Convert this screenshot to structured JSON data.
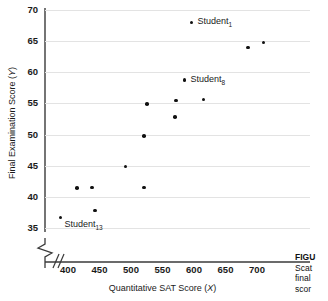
{
  "figure": {
    "axes": {
      "y": {
        "label_prefix": "Final Examination Score (",
        "label_var": "Y",
        "label_suffix": ")",
        "ticks": [
          70,
          65,
          60,
          55,
          50,
          45,
          40,
          35
        ],
        "min": 35,
        "max": 70,
        "break": true
      },
      "x": {
        "label_prefix": "Quantitative SAT Score (",
        "label_var": "X",
        "label_suffix": ")",
        "ticks": [
          400,
          450,
          500,
          550,
          600,
          650,
          700
        ],
        "min": 400,
        "max": 700,
        "break": true
      }
    },
    "caption": {
      "line1": "FIGU",
      "line2": "Scat",
      "line3": "final",
      "line4": "scor"
    }
  },
  "chart_data": {
    "type": "scatter",
    "title": "",
    "xlabel": "Quantitative SAT Score (X)",
    "ylabel": "Final Examination Score (Y)",
    "xlim": [
      365,
      740
    ],
    "ylim": [
      34,
      70
    ],
    "grid": true,
    "legend": "none",
    "marker_color": "#111111",
    "grid_color": "#e3e3e3",
    "points": [
      {
        "x": 388,
        "y": 36.7,
        "label": "Student",
        "sub": "13",
        "label_pos": "below-right"
      },
      {
        "x": 414,
        "y": 41.4,
        "label": "",
        "sub": "",
        "label_pos": ""
      },
      {
        "x": 438,
        "y": 41.5,
        "label": "",
        "sub": "",
        "label_pos": ""
      },
      {
        "x": 443,
        "y": 37.8,
        "label": "",
        "sub": "",
        "label_pos": ""
      },
      {
        "x": 491,
        "y": 44.9,
        "label": "",
        "sub": "",
        "label_pos": ""
      },
      {
        "x": 521,
        "y": 41.5,
        "label": "",
        "sub": "",
        "label_pos": ""
      },
      {
        "x": 521,
        "y": 49.8,
        "label": "",
        "sub": "",
        "label_pos": ""
      },
      {
        "x": 525,
        "y": 54.9,
        "label": "",
        "sub": "",
        "label_pos": ""
      },
      {
        "x": 570,
        "y": 52.8,
        "label": "",
        "sub": "",
        "label_pos": ""
      },
      {
        "x": 571,
        "y": 55.5,
        "label": "",
        "sub": "",
        "label_pos": ""
      },
      {
        "x": 585,
        "y": 58.8,
        "label": "Student",
        "sub": "8",
        "label_pos": "right"
      },
      {
        "x": 596,
        "y": 68.0,
        "label": "Student",
        "sub": "1",
        "label_pos": "right"
      },
      {
        "x": 615,
        "y": 55.6,
        "label": "",
        "sub": "",
        "label_pos": ""
      },
      {
        "x": 686,
        "y": 64.0,
        "label": "",
        "sub": "",
        "label_pos": ""
      },
      {
        "x": 710,
        "y": 64.8,
        "label": "",
        "sub": "",
        "label_pos": ""
      }
    ]
  }
}
